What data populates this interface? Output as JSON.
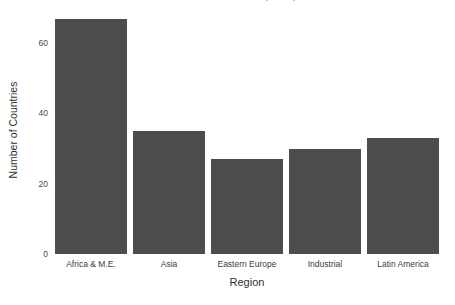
{
  "chart_data": {
    "type": "bar",
    "title": "Number of Countries by Region",
    "subtitle": "",
    "xlabel": "Region",
    "ylabel": "Number of Countries",
    "categories": [
      "Africa & M.E.",
      "Asia",
      "Eastern Europe",
      "Industrial",
      "Latin America"
    ],
    "values": [
      67,
      35,
      27,
      30,
      33
    ],
    "ylim": [
      0,
      70
    ],
    "yticks": [
      0,
      20,
      40,
      60
    ],
    "ytick_labels": [
      "0",
      "20",
      "40",
      "60"
    ],
    "grid": false,
    "legend": "none",
    "bar_color": "#4d4d4d",
    "background_color": "#ffffff",
    "orientation": "vertical"
  },
  "axes": {
    "y_title": "Number of Countries",
    "x_title": "Region"
  }
}
